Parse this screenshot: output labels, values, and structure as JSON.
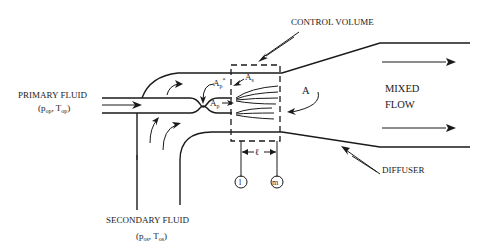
{
  "diagram": {
    "labels": {
      "control_volume": "CONTROL VOLUME",
      "primary_fluid": "PRIMARY FLUID",
      "primary_params_p": "p",
      "primary_params_p_sub": "op",
      "primary_params_t": "T",
      "primary_params_t_sub": "op",
      "secondary_fluid": "SECONDARY FLUID",
      "secondary_params_p": "p",
      "secondary_params_p_sub": "os",
      "secondary_params_t": "T",
      "secondary_params_t_sub": "os",
      "mixed": "MIXED",
      "flow": "FLOW",
      "diffuser": "DIFFUSER",
      "area_primary_star": "A",
      "area_primary_star_sub": "p",
      "area_primary_star_sup": "*",
      "area_primary": "A",
      "area_primary_sub": "p",
      "area_secondary": "A",
      "area_secondary_sub": "s",
      "area": "A",
      "length": "ℓ",
      "station_1": "l",
      "station_m": "m"
    }
  }
}
